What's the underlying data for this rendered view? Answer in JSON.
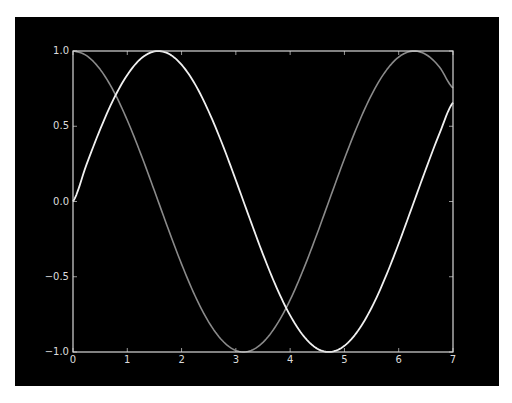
{
  "chart_data": {
    "type": "line",
    "title": "",
    "xlabel": "",
    "ylabel": "",
    "xlim": [
      0,
      7
    ],
    "ylim": [
      -1.0,
      1.0
    ],
    "grid": false,
    "legend": null,
    "xticks": [
      "0",
      "1",
      "2",
      "3",
      "4",
      "5",
      "6",
      "7"
    ],
    "yticks": [
      "−1.0",
      "−0.5",
      "0.0",
      "0.5",
      "1.0"
    ],
    "x": [
      0,
      0.25,
      0.5,
      0.75,
      1.0,
      1.25,
      1.5,
      1.75,
      2.0,
      2.25,
      2.5,
      2.75,
      3.0,
      3.25,
      3.5,
      3.75,
      4.0,
      4.25,
      4.5,
      4.75,
      5.0,
      5.25,
      5.5,
      5.75,
      6.0,
      6.25,
      6.5,
      6.75,
      7.0
    ],
    "series": [
      {
        "name": "sin(x)",
        "color": "#f0f0f0",
        "values": [
          0.0,
          0.247,
          0.479,
          0.682,
          0.841,
          0.949,
          0.997,
          0.984,
          0.909,
          0.778,
          0.598,
          0.382,
          0.141,
          -0.108,
          -0.351,
          -0.572,
          -0.757,
          -0.895,
          -0.978,
          -0.999,
          -0.959,
          -0.859,
          -0.706,
          -0.508,
          -0.279,
          -0.033,
          0.215,
          0.451,
          0.657
        ]
      },
      {
        "name": "cos(x)",
        "color": "#8a8a8a",
        "values": [
          1.0,
          0.969,
          0.878,
          0.732,
          0.54,
          0.315,
          0.071,
          -0.178,
          -0.416,
          -0.628,
          -0.801,
          -0.924,
          -0.99,
          -0.994,
          -0.936,
          -0.82,
          -0.654,
          -0.446,
          -0.211,
          0.038,
          0.284,
          0.512,
          0.709,
          0.861,
          0.96,
          0.999,
          0.977,
          0.894,
          0.754
        ]
      }
    ]
  },
  "colors": {
    "figure_background": "#000000",
    "axes_edge": "#d8d8d8",
    "tick_label": "#dcdcdc"
  }
}
